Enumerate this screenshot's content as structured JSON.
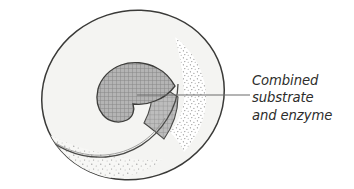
{
  "figure": {
    "type": "biology-diagram",
    "background_color": "#ffffff"
  },
  "diagram": {
    "enzyme_body": {
      "name": "enzyme-body",
      "fill_color": "#f4f4f2",
      "outline_color": "#3a3a38"
    },
    "active_site_rim": {
      "name": "active-site-rim",
      "outline_color": "#4a4a48"
    },
    "substrate_blob": {
      "name": "substrate-blob",
      "fill_color": "#a0a0a0",
      "hatch_color": "#7d7d7d",
      "outline_color": "#3d3d3b"
    },
    "shaded_wedge": {
      "name": "shaded-wedge",
      "fill_color": "#a8a8a8",
      "outline_color": "#4a4a48"
    },
    "stipple_right": {
      "name": "stipple-shading-right",
      "dot_color": "#8a8a8a"
    },
    "stipple_bottom": {
      "name": "stipple-shading-bottom",
      "dot_color": "#8a8a8a"
    },
    "leader_line": {
      "name": "leader-line",
      "color": "#6b6b6b",
      "start_x": 137,
      "start_y": 95,
      "end_x": 250,
      "end_y": 95
    }
  },
  "callout": {
    "name": "callout-label",
    "text_color": "#2d2d2b",
    "lines": [
      "Combined",
      "substrate",
      "and enzyme"
    ]
  }
}
